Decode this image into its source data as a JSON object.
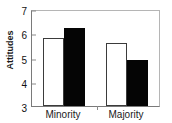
{
  "chart_data": {
    "type": "bar",
    "title": "",
    "xlabel": "",
    "ylabel": "Attitudes",
    "ylim": [
      3,
      7
    ],
    "yticks": [
      3,
      4,
      5,
      6,
      7
    ],
    "ytick_labels": [
      "3",
      "4",
      "5",
      "6",
      "7"
    ],
    "grid": false,
    "legend": "none",
    "categories": [
      "Minority",
      "Majority"
    ],
    "series": [
      {
        "name": "open",
        "fill": "#ffffff",
        "values": [
          5.8,
          5.6
        ]
      },
      {
        "name": "filled",
        "fill": "#050505",
        "values": [
          6.2,
          4.9
        ]
      }
    ]
  },
  "axis": {
    "y_title": "Attitudes"
  },
  "colors": {
    "open_bar_fill": "#ffffff",
    "open_bar_edge": "#3b3b3b",
    "filled_bar_fill": "#050505",
    "frame": "#7a7a7a",
    "text": "#1a1a1a"
  }
}
